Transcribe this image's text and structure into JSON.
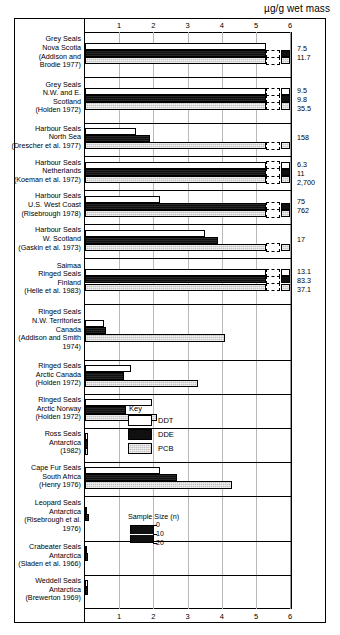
{
  "axis_title": "µg/g wet mass",
  "key": {
    "title": "Key",
    "items": [
      {
        "label": "DDT",
        "swatch": "white-open-bar",
        "color": "#ffffff"
      },
      {
        "label": "DDE",
        "swatch": "black-filled-bar",
        "color": "#101010"
      },
      {
        "label": "PCB",
        "swatch": "gray-stippled-bar",
        "color": "#c3c3c3"
      }
    ]
  },
  "sample_size_legend": {
    "title": "Sample Size (n)",
    "ticks": [
      "0",
      "10",
      "20"
    ]
  },
  "chart_data": {
    "type": "bar",
    "orientation": "horizontal",
    "title": "",
    "xlabel": "µg/g wet mass",
    "ylabel": "",
    "xlim": [
      0,
      6
    ],
    "xticks": [
      "1",
      "2",
      "3",
      "4",
      "5",
      "6"
    ],
    "grid": true,
    "legend_position": "inside-right",
    "axis_duplicated_top_and_bottom": true,
    "note": "Bars exceeding the 6 µg/g axis are broken with a dashed gap and a short terminal stub; their true values are printed at the right margin.",
    "series": [
      "DDT",
      "DDE",
      "PCB"
    ],
    "categories": [
      {
        "name": "Grey Seals Nova Scotia",
        "lines": [
          "Grey Seals",
          "Nova Scotia",
          "(Addison and",
          "Brodie 1977)"
        ],
        "values": {
          "DDT": 5.3,
          "DDE": 7.5,
          "PCB": 11.7
        },
        "plotted": {
          "DDT": 5.3,
          "DDE": 6.0,
          "PCB": 6.0
        },
        "offscale": {
          "DDT": false,
          "DDE": true,
          "PCB": true
        },
        "value_labels": [
          "7.5",
          "11.7"
        ]
      },
      {
        "name": "Grey Seals N.W. and E. Scotland",
        "lines": [
          "Grey Seals",
          "N.W. and E.",
          "Scotland",
          "(Holden 1972)"
        ],
        "values": {
          "DDT": 9.5,
          "DDE": 9.8,
          "PCB": 35.5
        },
        "plotted": {
          "DDT": 6.0,
          "DDE": 6.0,
          "PCB": 6.0
        },
        "offscale": {
          "DDT": true,
          "DDE": true,
          "PCB": true
        },
        "value_labels": [
          "9.5",
          "9.8",
          "35.5"
        ]
      },
      {
        "name": "Harbour Seals North Sea",
        "lines": [
          "Harbour Seals",
          "North Sea",
          "(Drescher et al. 1977)"
        ],
        "values": {
          "DDT": 1.5,
          "DDE": 1.9,
          "PCB": 158
        },
        "plotted": {
          "DDT": 1.5,
          "DDE": 1.9,
          "PCB": 6.0
        },
        "offscale": {
          "DDT": false,
          "DDE": false,
          "PCB": true
        },
        "value_labels": [
          "158"
        ]
      },
      {
        "name": "Harbour Seals Netherlands",
        "lines": [
          "Harbour Seals",
          "Netherlands",
          "(Koeman et al. 1972)"
        ],
        "values": {
          "DDT": 6.3,
          "DDE": 11,
          "PCB": 2700
        },
        "plotted": {
          "DDT": 6.0,
          "DDE": 6.0,
          "PCB": 6.0
        },
        "offscale": {
          "DDT": true,
          "DDE": true,
          "PCB": true
        },
        "value_labels": [
          "6.3",
          "11",
          "2,700"
        ]
      },
      {
        "name": "Harbour Seals U.S. West Coast",
        "lines": [
          "Harbour Seals",
          "U.S. West Coast",
          "(Risebrough 1978)"
        ],
        "values": {
          "DDT": 2.2,
          "DDE": 75,
          "PCB": 762
        },
        "plotted": {
          "DDT": 2.2,
          "DDE": 6.0,
          "PCB": 6.0
        },
        "offscale": {
          "DDT": false,
          "DDE": true,
          "PCB": true
        },
        "value_labels": [
          "75",
          "762"
        ]
      },
      {
        "name": "Harbour Seals W. Scotland",
        "lines": [
          "Harbour Seals",
          "W. Scotland",
          "(Gaskin et al. 1973)"
        ],
        "values": {
          "DDT": 3.5,
          "DDE": 3.9,
          "PCB": 17
        },
        "plotted": {
          "DDT": 3.5,
          "DDE": 3.9,
          "PCB": 6.0
        },
        "offscale": {
          "DDT": false,
          "DDE": false,
          "PCB": true
        },
        "value_labels": [
          "17"
        ]
      },
      {
        "name": "Saimaa Ringed Seals Finland",
        "lines": [
          "Saimaa",
          "Ringed Seals",
          "Finland",
          "(Helle et al. 1983)"
        ],
        "values": {
          "DDT": 13.1,
          "DDE": 83.3,
          "PCB": 37.1
        },
        "plotted": {
          "DDT": 6.0,
          "DDE": 6.0,
          "PCB": 6.0
        },
        "offscale": {
          "DDT": true,
          "DDE": true,
          "PCB": true
        },
        "value_labels": [
          "13.1",
          "83.3",
          "37.1"
        ]
      },
      {
        "name": "Ringed Seals N.W. Territories Canada",
        "lines": [
          "Ringed Seals",
          "N.W. Territories",
          "Canada",
          "(Addison and Smith",
          "1974)"
        ],
        "values": {
          "DDT": 0.55,
          "DDE": 0.6,
          "PCB": 4.1
        },
        "plotted": {
          "DDT": 0.55,
          "DDE": 0.6,
          "PCB": 4.1
        },
        "offscale": {
          "DDT": false,
          "DDE": false,
          "PCB": false
        },
        "value_labels": []
      },
      {
        "name": "Ringed Seals Arctic Canada",
        "lines": [
          "Ringed Seals",
          "Arctic Canada",
          "(Holden 1972)"
        ],
        "values": {
          "DDT": 1.35,
          "DDE": 1.15,
          "PCB": 3.3
        },
        "plotted": {
          "DDT": 1.35,
          "DDE": 1.15,
          "PCB": 3.3
        },
        "offscale": {
          "DDT": false,
          "DDE": false,
          "PCB": false
        },
        "value_labels": []
      },
      {
        "name": "Ringed Seals Arctic Norway",
        "lines": [
          "Ringed Seals",
          "Arctic Norway",
          "(Holden 1972)"
        ],
        "values": {
          "DDT": 1.95,
          "DDE": 1.2,
          "PCB": 2.1
        },
        "plotted": {
          "DDT": 1.95,
          "DDE": 1.2,
          "PCB": 2.1
        },
        "offscale": {
          "DDT": false,
          "DDE": false,
          "PCB": false
        },
        "value_labels": []
      },
      {
        "name": "Ross Seals Antarctica",
        "lines": [
          "Ross Seals",
          "Antarctica",
          "(1982)"
        ],
        "values": {
          "DDT": 0.1,
          "DDE": 0.1,
          "PCB": 0.1
        },
        "plotted": {
          "DDT": 0.1,
          "DDE": 0.1,
          "PCB": 0.1
        },
        "offscale": {
          "DDT": false,
          "DDE": false,
          "PCB": false
        },
        "value_labels": []
      },
      {
        "name": "Cape Fur Seals South Africa",
        "lines": [
          "Cape Fur Seals",
          "South Africa",
          "(Henry 1976)"
        ],
        "values": {
          "DDT": 2.2,
          "DDE": 2.7,
          "PCB": 4.3
        },
        "plotted": {
          "DDT": 2.2,
          "DDE": 2.7,
          "PCB": 4.3
        },
        "offscale": {
          "DDT": false,
          "DDE": false,
          "PCB": false
        },
        "value_labels": []
      },
      {
        "name": "Leopard Seals Antarctica",
        "lines": [
          "Leopard Seals",
          "Antarctica",
          "(Risebrough et al.",
          "1976)"
        ],
        "values": {
          "DDT": 0.07,
          "DDE": 0.12,
          "PCB": 0.0
        },
        "plotted": {
          "DDT": 0.07,
          "DDE": 0.12,
          "PCB": 0.0
        },
        "offscale": {
          "DDT": false,
          "DDE": false,
          "PCB": false
        },
        "value_labels": []
      },
      {
        "name": "Crabeater Seals Antarctica",
        "lines": [
          "Crabeater Seals",
          "Antarctica",
          "(Sladen et al. 1966)"
        ],
        "values": {
          "DDT": 0.07,
          "DDE": 0.1,
          "PCB": 0.0
        },
        "plotted": {
          "DDT": 0.07,
          "DDE": 0.1,
          "PCB": 0.0
        },
        "offscale": {
          "DDT": false,
          "DDE": false,
          "PCB": false
        },
        "value_labels": []
      },
      {
        "name": "Weddell Seals Antarctica",
        "lines": [
          "Weddell Seals",
          "Antarctica",
          "(Brewerton 1969)"
        ],
        "values": {
          "DDT": 0.08,
          "DDE": 0.08,
          "PCB": 0.0
        },
        "plotted": {
          "DDT": 0.08,
          "DDE": 0.08,
          "PCB": 0.0
        },
        "offscale": {
          "DDT": false,
          "DDE": false,
          "PCB": false
        },
        "value_labels": []
      }
    ]
  }
}
